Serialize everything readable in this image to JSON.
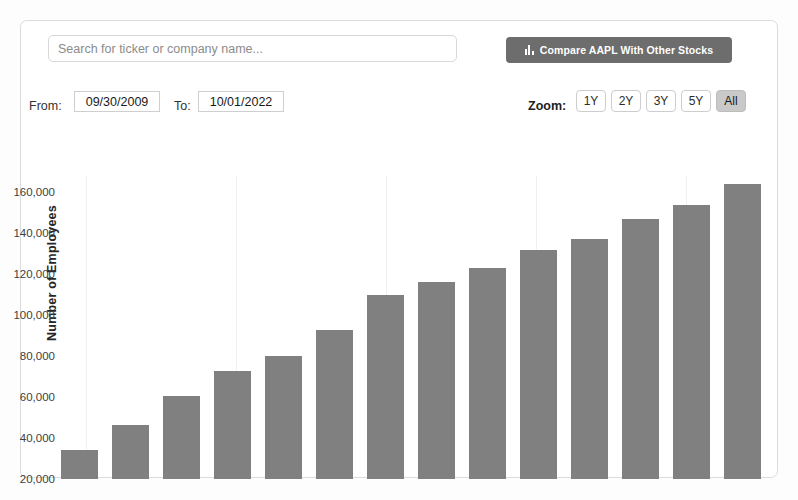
{
  "search": {
    "placeholder": "Search for ticker or company name...",
    "value": ""
  },
  "toolbar": {
    "compare_label": "Compare AAPL With Other Stocks",
    "compare_icon": "bar-chart-icon",
    "compare_bg": "#6d6d6d"
  },
  "controls": {
    "from_label": "From:",
    "from_value": "09/30/2009",
    "to_label": "To:",
    "to_value": "10/01/2022",
    "zoom_label": "Zoom:",
    "zoom_options": [
      "1Y",
      "2Y",
      "3Y",
      "5Y",
      "All"
    ],
    "zoom_selected": "All"
  },
  "colors": {
    "bar": "#808080",
    "grid": "#f0f0f0",
    "card_border": "#dcdcdc",
    "active_button": "#c9c9c9"
  },
  "chart_data": {
    "type": "bar",
    "title": "",
    "xlabel": "",
    "ylabel": "Number of Employees",
    "ylim": [
      20000,
      168000
    ],
    "yticks": [
      20000,
      40000,
      60000,
      80000,
      100000,
      120000,
      140000,
      160000
    ],
    "ytick_labels": [
      "20,000",
      "40,000",
      "60,000",
      "80,000",
      "100,000",
      "120,000",
      "140,000",
      "160,000"
    ],
    "grid": "vertical-only",
    "legend": "none",
    "categories": [
      "2009",
      "2010",
      "2011",
      "2012",
      "2013",
      "2014",
      "2015",
      "2016",
      "2017",
      "2018",
      "2019",
      "2020",
      "2021",
      "2022"
    ],
    "values": [
      34300,
      46600,
      60400,
      72800,
      80300,
      92600,
      110000,
      116000,
      123000,
      132000,
      137000,
      147000,
      154000,
      164000
    ]
  }
}
